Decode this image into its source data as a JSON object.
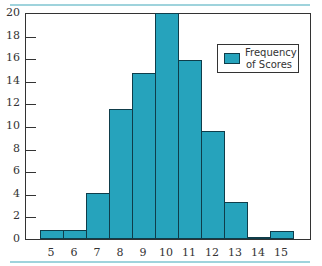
{
  "chart_data": {
    "type": "bar",
    "title": "",
    "xlabel": "",
    "ylabel": "",
    "categories": [
      "5",
      "6",
      "7",
      "8",
      "9",
      "10",
      "11",
      "12",
      "13",
      "14",
      "15"
    ],
    "series": [
      {
        "name": "Frequency of Scores",
        "values": [
          0.8,
          0.8,
          4.1,
          11.5,
          14.7,
          20,
          15.8,
          9.6,
          3.3,
          0.1,
          0.7
        ]
      }
    ],
    "ylim": [
      0,
      20
    ],
    "yticks": [
      "0",
      "2",
      "4",
      "6",
      "8",
      "10",
      "12",
      "14",
      "16",
      "18",
      "20"
    ],
    "grid": false,
    "legend_position": "upper right",
    "colors": {
      "bar": "#26a3bc",
      "edge": "#0f3d4a",
      "rule": "#9fd3dc"
    }
  },
  "legend": {
    "line1": "Frequency",
    "line2": "of Scores"
  }
}
